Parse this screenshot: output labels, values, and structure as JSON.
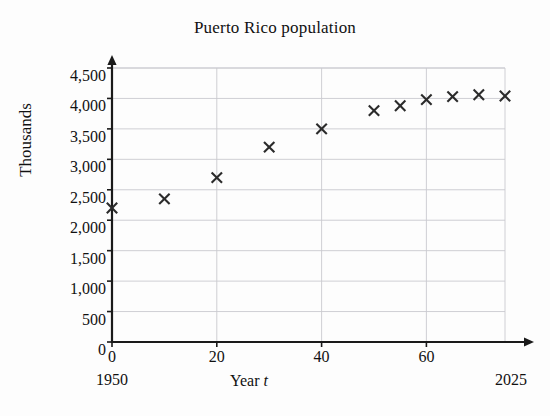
{
  "chart_data": {
    "type": "scatter",
    "title": "Puerto Rico population",
    "xlabel": "Year t",
    "xlabel_prefix": "Year ",
    "xlabel_variable": "t",
    "ylabel": "Thousands",
    "xlim": [
      0,
      75
    ],
    "ylim": [
      0,
      4500
    ],
    "grid": true,
    "legend": null,
    "x_tick_labels": [
      "0",
      "20",
      "40",
      "60"
    ],
    "x_ticks": [
      0,
      20,
      40,
      60
    ],
    "y_tick_labels": [
      "0",
      "500",
      "1,000",
      "1,500",
      "2,000",
      "2,500",
      "3,000",
      "3,500",
      "4,000",
      "4,500"
    ],
    "y_ticks": [
      0,
      500,
      1000,
      1500,
      2000,
      2500,
      3000,
      3500,
      4000,
      4500
    ],
    "x_axis_start_year": "1950",
    "x_axis_end_year": "2025",
    "marker": "x",
    "marker_color": "#2b2b2b",
    "gridline_color": "#c9c9cf",
    "axis_color": "#1a1a1a",
    "background_color": "#fdfdfd",
    "x": [
      0,
      10,
      20,
      30,
      40,
      50,
      55,
      60,
      65,
      70,
      75
    ],
    "y": [
      2200,
      2350,
      2700,
      3200,
      3500,
      3800,
      3880,
      3980,
      4030,
      4060,
      4040
    ],
    "points": [
      {
        "t": 0,
        "year": 1950,
        "population_thousands": 2200
      },
      {
        "t": 10,
        "year": 1960,
        "population_thousands": 2350
      },
      {
        "t": 20,
        "year": 1970,
        "population_thousands": 2700
      },
      {
        "t": 30,
        "year": 1980,
        "population_thousands": 3200
      },
      {
        "t": 40,
        "year": 1990,
        "population_thousands": 3500
      },
      {
        "t": 50,
        "year": 2000,
        "population_thousands": 3800
      },
      {
        "t": 55,
        "year": 2005,
        "population_thousands": 3880
      },
      {
        "t": 60,
        "year": 2010,
        "population_thousands": 3980
      },
      {
        "t": 65,
        "year": 2015,
        "population_thousands": 4030
      },
      {
        "t": 70,
        "year": 2020,
        "population_thousands": 4060
      },
      {
        "t": 75,
        "year": 2025,
        "population_thousands": 4040
      }
    ]
  }
}
